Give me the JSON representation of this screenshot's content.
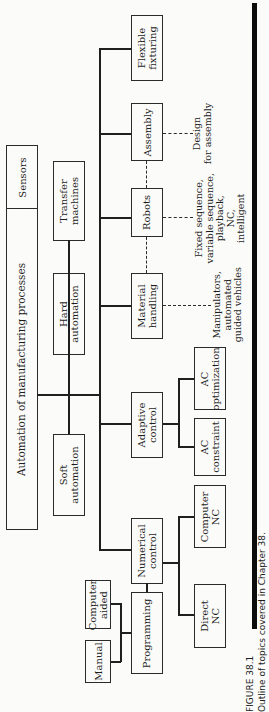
{
  "diagram": {
    "root": "Automation of manufacturing processes",
    "sensors": "Sensors",
    "level1": {
      "transfer": "Transfer\nmachines",
      "hard": "Hard\nautomation",
      "soft": "Soft\nautomation"
    },
    "level2": {
      "flexible": "Flexible\nfixturing",
      "assembly": "Assembly",
      "robots": "Robots",
      "material": "Material\nhandling",
      "adaptive": "Adaptive\ncontrol",
      "numerical": "Numerical\ncontrol",
      "programming": "Programming"
    },
    "level3": {
      "ac_opt": "AC\noptimization",
      "ac_con": "AC\nconstraint",
      "comp_nc": "Computer\nNC",
      "direct_nc": "Direct\nNC",
      "manual": "Manual",
      "comp_aided": "Computer\naided"
    },
    "notes": {
      "assembly": "Design\nfor assembly",
      "robots": "Fixed sequence,\nvariable sequence,\nplayback,\nNC,\nintelligent",
      "material": "Manipulators,\nautomated\nguided vehicles"
    }
  },
  "caption": {
    "label": "FIGURE 38.1",
    "text": "Outline of topics covered in Chapter 38."
  }
}
